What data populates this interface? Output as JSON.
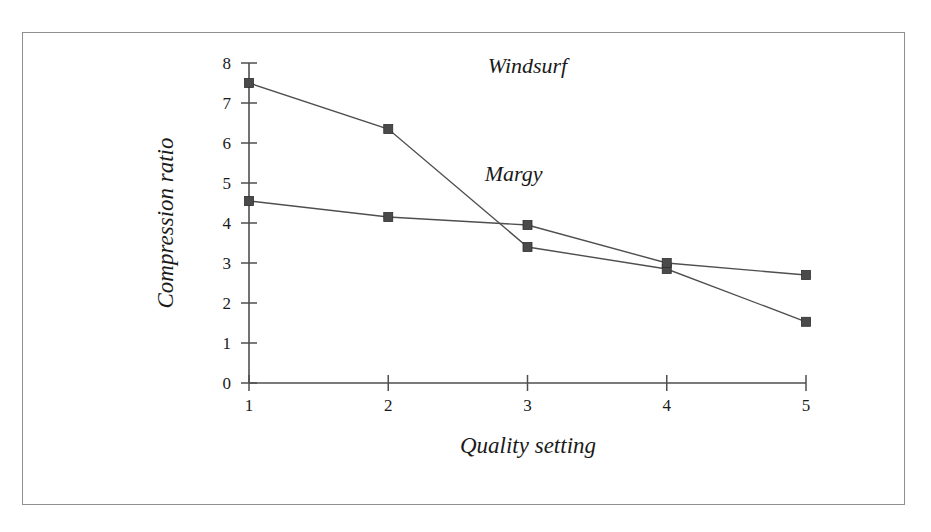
{
  "chart_data": {
    "type": "line",
    "title": "",
    "xlabel": "Quality setting",
    "ylabel": "Compression ratio",
    "x": [
      1,
      2,
      3,
      4,
      5
    ],
    "categories": [
      "1",
      "2",
      "3",
      "4",
      "5"
    ],
    "xtick_labels": [
      "1",
      "2",
      "3",
      "4",
      "5"
    ],
    "ytick_labels": [
      "0",
      "1",
      "2",
      "3",
      "4",
      "5",
      "6",
      "7",
      "8"
    ],
    "ytick_values": [
      0,
      1,
      2,
      3,
      4,
      5,
      6,
      7,
      8
    ],
    "xlim": [
      1,
      5
    ],
    "ylim": [
      0,
      8
    ],
    "grid": false,
    "legend_position": "inline-annotation",
    "marker": "square",
    "marker_color": "#4a4a4a",
    "line_color": "#4f4f4f",
    "series": [
      {
        "name": "Windsurf",
        "values": [
          7.5,
          6.35,
          3.4,
          2.85,
          1.53
        ],
        "label_x": 3.0,
        "label_y": 7.75
      },
      {
        "name": "Margy",
        "values": [
          4.55,
          4.15,
          3.95,
          3.0,
          2.7
        ],
        "label_x": 2.9,
        "label_y": 5.05
      }
    ]
  },
  "figure": {
    "border_color": "#8f8f8f",
    "background": "#ffffff"
  }
}
